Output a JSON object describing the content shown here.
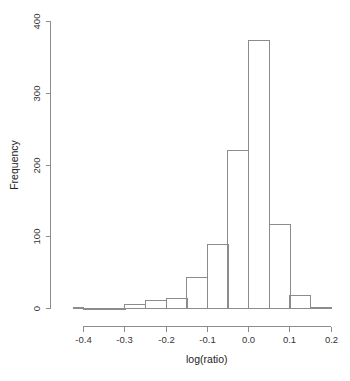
{
  "chart_data": {
    "type": "bar",
    "title": "",
    "subtitle": "",
    "xlabel": "log(ratio)",
    "ylabel": "Frequency",
    "grid": false,
    "legend": null,
    "bin_width": 0.05,
    "xlim": [
      -0.45,
      0.21
    ],
    "ylim": [
      0,
      400
    ],
    "x_ticks": [
      -0.4,
      -0.3,
      -0.2,
      -0.1,
      0.0,
      0.1,
      0.2
    ],
    "x_tick_labels": [
      "-0.4",
      "-0.3",
      "-0.2",
      "-0.1",
      "0.0",
      "0.1",
      "0.2"
    ],
    "x_axis_range": [
      -0.425,
      0.2
    ],
    "y_ticks": [
      0,
      100,
      200,
      300,
      400
    ],
    "y_tick_labels": [
      "0",
      "100",
      "200",
      "300",
      "400"
    ],
    "bins": [
      {
        "x0": -0.425,
        "x1": -0.4,
        "value": 1
      },
      {
        "x0": -0.4,
        "x1": -0.35,
        "value": 0
      },
      {
        "x0": -0.35,
        "x1": -0.3,
        "value": 0
      },
      {
        "x0": -0.3,
        "x1": -0.25,
        "value": 5
      },
      {
        "x0": -0.25,
        "x1": -0.2,
        "value": 11
      },
      {
        "x0": -0.2,
        "x1": -0.15,
        "value": 14
      },
      {
        "x0": -0.15,
        "x1": -0.1,
        "value": 43
      },
      {
        "x0": -0.1,
        "x1": -0.05,
        "value": 89
      },
      {
        "x0": -0.05,
        "x1": 0.0,
        "value": 220
      },
      {
        "x0": 0.0,
        "x1": 0.05,
        "value": 373
      },
      {
        "x0": 0.05,
        "x1": 0.1,
        "value": 117
      },
      {
        "x0": 0.1,
        "x1": 0.15,
        "value": 18
      },
      {
        "x0": 0.15,
        "x1": 0.2,
        "value": 2
      }
    ],
    "categories": [
      "-0.425",
      "-0.40",
      "-0.35",
      "-0.30",
      "-0.25",
      "-0.20",
      "-0.15",
      "-0.10",
      "-0.05",
      "0.00",
      "0.05",
      "0.10",
      "0.15"
    ],
    "values": [
      1,
      0,
      0,
      5,
      11,
      14,
      43,
      89,
      220,
      373,
      117,
      18,
      2
    ],
    "colors": {
      "background": "#ffffff",
      "bar_stroke": "#8c8c8c",
      "bar_fill": "none",
      "axis": "#8c8c8c",
      "text": "#333333"
    }
  }
}
